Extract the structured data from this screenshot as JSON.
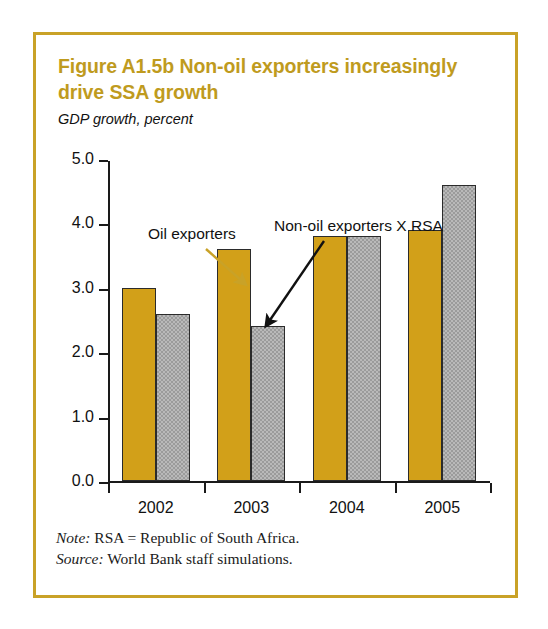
{
  "figure": {
    "title": "Figure A1.5b  Non-oil exporters increasingly drive SSA growth",
    "subtitle": "GDP growth, percent",
    "frame_color": "#c9a227",
    "title_color": "#bf9b1e"
  },
  "notes": {
    "note_lead": "Note:",
    "note_text": " RSA = Republic of South Africa.",
    "source_lead": "Source:",
    "source_text": " World Bank staff simulations."
  },
  "annotations": [
    {
      "id": "oil-exporters",
      "text": "Oil exporters",
      "arrow_color": "#c9a227"
    },
    {
      "id": "nonoil-exporters",
      "text": "Non-oil exporters X RSA",
      "arrow_color": "#111111"
    }
  ],
  "chart_data": {
    "type": "bar",
    "title": "Figure A1.5b  Non-oil exporters increasingly drive SSA growth",
    "subtitle": "GDP growth, percent",
    "xlabel": "",
    "ylabel": "GDP growth, percent",
    "ylim": [
      0.0,
      5.0
    ],
    "ytick_labels": [
      "0.0",
      "1.0",
      "2.0",
      "3.0",
      "4.0",
      "5.0"
    ],
    "ytick_values": [
      0.0,
      1.0,
      2.0,
      3.0,
      4.0,
      5.0
    ],
    "grid": false,
    "legend": "none",
    "categories": [
      "2002",
      "2003",
      "2004",
      "2005"
    ],
    "series": [
      {
        "name": "Oil exporters",
        "color": "#d2a019",
        "values": [
          3.0,
          3.6,
          3.8,
          3.9
        ]
      },
      {
        "name": "Non-oil exporters X RSA",
        "color": "#9b9b9b",
        "values": [
          2.6,
          2.4,
          3.8,
          4.6
        ]
      }
    ]
  }
}
